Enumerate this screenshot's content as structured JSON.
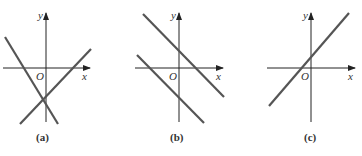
{
  "panels": [
    {
      "id": "a",
      "caption": "(a)",
      "x_label": "x",
      "y_label": "y",
      "origin_label": "O",
      "description": "Two lines intersecting below the x-axis near the negative y-axis: one with negative slope, one with positive slope"
    },
    {
      "id": "b",
      "caption": "(b)",
      "x_label": "x",
      "y_label": "y",
      "origin_label": "O",
      "description": "Two parallel lines with negative slope; one with positive y-intercept, one with negative y-intercept"
    },
    {
      "id": "c",
      "caption": "(c)",
      "x_label": "x",
      "y_label": "y",
      "origin_label": "O",
      "description": "Single line with positive slope and small positive y-intercept"
    }
  ]
}
